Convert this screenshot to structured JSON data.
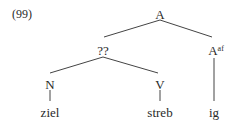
{
  "example_number": "(99)",
  "tree": {
    "root": {
      "label": "A"
    },
    "mid": {
      "label": "??"
    },
    "right": {
      "label": "A",
      "superscript": "af"
    },
    "n": {
      "label": "N"
    },
    "v": {
      "label": "V"
    },
    "leaves": [
      "ziel",
      "streb",
      "ig"
    ]
  }
}
